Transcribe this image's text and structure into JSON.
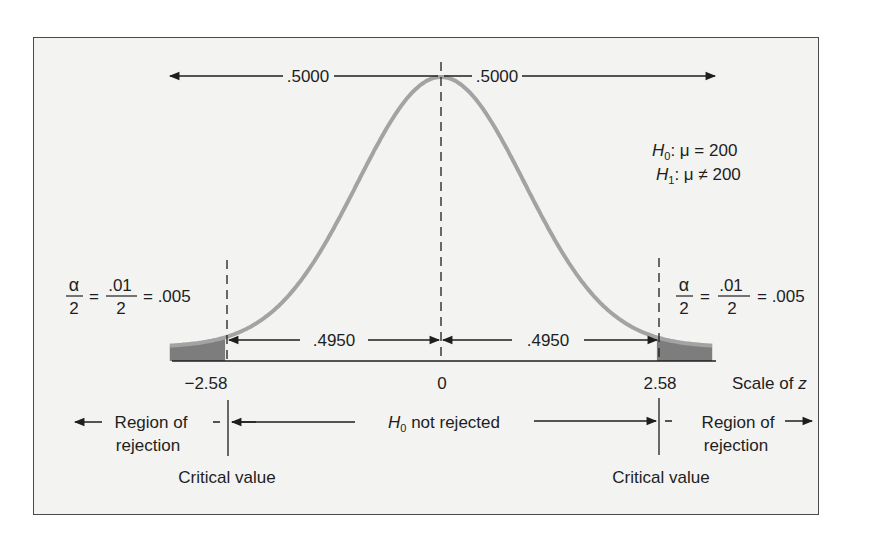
{
  "chart_data": {
    "type": "area",
    "distribution": "standard normal",
    "xlabel": "Scale of z",
    "ylabel": "",
    "x_ticks": [
      -2.58,
      0,
      2.58
    ],
    "x_tick_labels": [
      "−2.58",
      "0",
      "2.58"
    ],
    "critical_values": [
      -2.58,
      2.58
    ],
    "shaded_regions": [
      {
        "from": "-inf",
        "to": -2.58,
        "area": 0.005
      },
      {
        "from": 2.58,
        "to": "inf",
        "area": 0.005
      }
    ],
    "areas": {
      "left_half": 0.5,
      "right_half": 0.5,
      "center_left": 0.495,
      "center_right": 0.495,
      "left_tail": 0.005,
      "right_tail": 0.005
    },
    "grid": false,
    "legend": null
  },
  "labels": {
    "half_left": ".5000",
    "half_right": ".5000",
    "center_left": ".4950",
    "center_right": ".4950",
    "tick_neg": "−2.58",
    "tick_zero": "0",
    "tick_pos": "2.58",
    "scale_label": "Scale of z",
    "scale_prefix": "Scale of ",
    "scale_var": "z",
    "hypotheses": {
      "h0_symbol": "H",
      "h0_sub": "0",
      "h0_rest": ": μ = 200",
      "h1_symbol": "H",
      "h1_sub": "1",
      "h1_rest": ": μ ≠ 200"
    },
    "tail_formula": {
      "alpha": "α",
      "two": "2",
      "eq": "=",
      "num": ".01",
      "den": "2",
      "result": "= .005"
    },
    "region_left_line1": "Region of",
    "region_left_line2": "rejection",
    "region_right_line1": "Region of",
    "region_right_line2": "rejection",
    "not_rejected_h": "H",
    "not_rejected_sub": "0",
    "not_rejected_rest": " not rejected",
    "critical_left": "Critical value",
    "critical_right": "Critical value"
  },
  "colors": {
    "curve": "#a3a3a3",
    "shade": "#7d7d7d",
    "ink": "#1e1e1e",
    "panel": "#f3f3f1",
    "frame": "#4a4a4a"
  }
}
